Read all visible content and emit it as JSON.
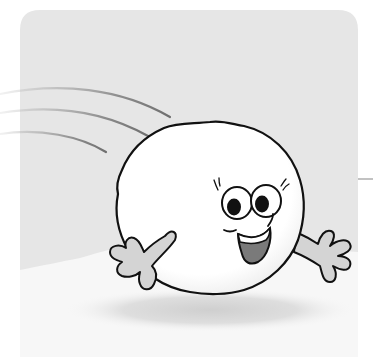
{
  "illustration": {
    "subject": "smiling snowball character rolling on snow",
    "colors": {
      "page_background": "#ffffff",
      "panel_background": "#e6e6e6",
      "snow_ground": "#f6f6f6",
      "snowball_fill": "#ffffff",
      "outline": "#111111",
      "hands_fill": "#d4d4d4",
      "mouth_inner": "#7a7a7a",
      "motion_lines": "#8a8a8a",
      "shadow": "#d8d8d8",
      "horizon_line": "#9a9a9a"
    },
    "elements": {
      "motion_lines_count": 3,
      "eyes_count": 2,
      "hands_count": 2
    }
  }
}
